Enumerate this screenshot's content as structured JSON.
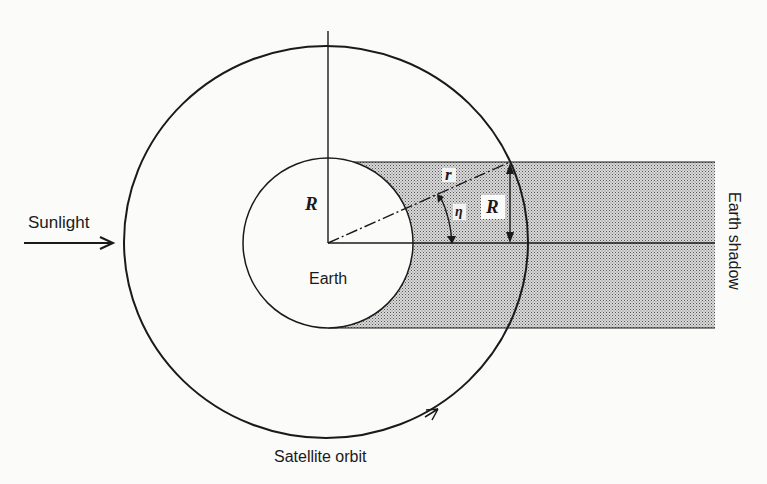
{
  "figure": {
    "type": "orbital-geometry-diagram",
    "labels": {
      "sunlight": "Sunlight",
      "earth": "Earth",
      "earth_shadow": "Earth shadow",
      "satellite_orbit": "Satellite orbit",
      "earth_radius": "R",
      "shadow_half_width": "R",
      "orbit_radius": "r",
      "angle": "η"
    },
    "colors": {
      "ink": "#1a1a1a",
      "background": "#fbfbfa",
      "shadow_fill": "#bdbdbd"
    }
  }
}
